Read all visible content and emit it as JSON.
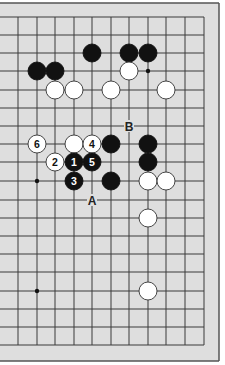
{
  "diagram": {
    "type": "go-board-fragment",
    "colors": {
      "board": "#dedede",
      "frame": "#555555",
      "line": "#3a3a3a",
      "black_stone": "#111111",
      "white_stone": "#ffffff",
      "outside": "#ffffff"
    },
    "grid": {
      "x_lines": [
        0,
        18,
        37,
        55,
        74,
        92,
        111,
        129,
        148,
        166,
        185,
        204
      ],
      "y_lines": [
        17,
        35,
        53,
        71,
        90,
        108,
        126,
        144,
        162,
        181,
        200,
        218,
        236,
        254,
        272,
        291,
        309,
        327,
        345
      ]
    },
    "star_points": [
      {
        "x": 148,
        "y": 71
      },
      {
        "x": 37,
        "y": 181
      },
      {
        "x": 37,
        "y": 291
      }
    ],
    "stones": [
      {
        "color": "black",
        "x": 92,
        "y": 53,
        "label": ""
      },
      {
        "color": "black",
        "x": 129,
        "y": 53,
        "label": ""
      },
      {
        "color": "black",
        "x": 148,
        "y": 53,
        "label": ""
      },
      {
        "color": "black",
        "x": 37,
        "y": 71,
        "label": ""
      },
      {
        "color": "black",
        "x": 55,
        "y": 71,
        "label": ""
      },
      {
        "color": "white",
        "x": 129,
        "y": 71,
        "label": ""
      },
      {
        "color": "white",
        "x": 55,
        "y": 90,
        "label": ""
      },
      {
        "color": "white",
        "x": 74,
        "y": 90,
        "label": ""
      },
      {
        "color": "white",
        "x": 111,
        "y": 90,
        "label": ""
      },
      {
        "color": "white",
        "x": 166,
        "y": 90,
        "label": ""
      },
      {
        "color": "white",
        "x": 37,
        "y": 144,
        "label": "6"
      },
      {
        "color": "white",
        "x": 74,
        "y": 144,
        "label": ""
      },
      {
        "color": "white",
        "x": 92,
        "y": 144,
        "label": "4"
      },
      {
        "color": "black",
        "x": 111,
        "y": 144,
        "label": ""
      },
      {
        "color": "black",
        "x": 148,
        "y": 144,
        "label": ""
      },
      {
        "color": "white",
        "x": 55,
        "y": 162,
        "label": "2"
      },
      {
        "color": "black",
        "x": 74,
        "y": 162,
        "label": "1"
      },
      {
        "color": "black",
        "x": 92,
        "y": 162,
        "label": "5"
      },
      {
        "color": "black",
        "x": 148,
        "y": 162,
        "label": ""
      },
      {
        "color": "black",
        "x": 74,
        "y": 181,
        "label": "3"
      },
      {
        "color": "black",
        "x": 111,
        "y": 181,
        "label": ""
      },
      {
        "color": "white",
        "x": 148,
        "y": 181,
        "label": ""
      },
      {
        "color": "white",
        "x": 166,
        "y": 181,
        "label": ""
      },
      {
        "color": "white",
        "x": 148,
        "y": 218,
        "label": ""
      },
      {
        "color": "white",
        "x": 148,
        "y": 291,
        "label": ""
      }
    ],
    "letter_labels": [
      {
        "text": "A",
        "x": 92,
        "y": 200
      },
      {
        "text": "B",
        "x": 129,
        "y": 126
      }
    ]
  }
}
